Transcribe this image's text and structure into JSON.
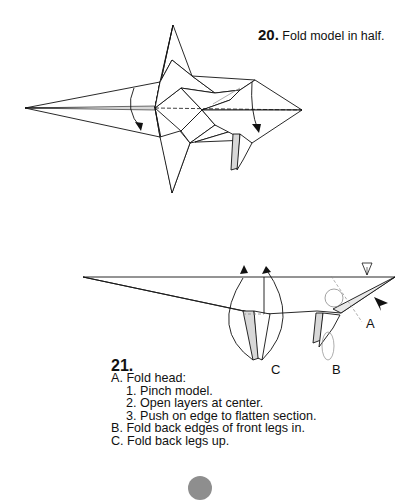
{
  "step20": {
    "number": "20.",
    "instruction": "Fold model in half."
  },
  "step21": {
    "number": "21.",
    "instructions": [
      {
        "text": "A. Fold head:",
        "indent": false
      },
      {
        "text": "1. Pinch model.",
        "indent": true
      },
      {
        "text": "2. Open layers at center.",
        "indent": true
      },
      {
        "text": "3. Push on edge to flatten section.",
        "indent": true
      },
      {
        "text": "B. Fold back edges of front legs in.",
        "indent": false
      },
      {
        "text": "C. Fold back legs up.",
        "indent": false
      }
    ],
    "diagram_labels": {
      "a": "A",
      "b": "B",
      "c": "C"
    }
  },
  "colors": {
    "line": "#111111",
    "paper": "#ffffff",
    "shade": "#d8d8d8",
    "gray_line": "#8a8a8a",
    "page_marker": "#8e8e8e"
  }
}
